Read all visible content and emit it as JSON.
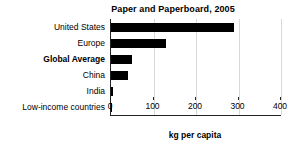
{
  "chart_data": {
    "type": "bar",
    "orientation": "horizontal",
    "title": "Paper and Paperboard, 2005",
    "xlabel": "kg per capita",
    "ylabel": "",
    "xlim": [
      0,
      400
    ],
    "xticks": [
      0,
      100,
      200,
      300,
      400
    ],
    "xtick_labels": [
      "0",
      "100",
      "200",
      "300",
      "400"
    ],
    "grid": true,
    "legend": "none",
    "bar_color": "#000000",
    "categories": [
      "United States",
      "Europe",
      "Global Average",
      "China",
      "India",
      "Low-income countries"
    ],
    "values": [
      290,
      130,
      50,
      40,
      5,
      1
    ],
    "emphasized_category": "Global Average",
    "bars": [
      {
        "label": "United States",
        "value": 290,
        "bold": false
      },
      {
        "label": "Europe",
        "value": 130,
        "bold": false
      },
      {
        "label": "Global Average",
        "value": 50,
        "bold": true
      },
      {
        "label": "China",
        "value": 40,
        "bold": false
      },
      {
        "label": "India",
        "value": 5,
        "bold": false
      },
      {
        "label": "Low-income countries",
        "value": 1,
        "bold": false
      }
    ]
  },
  "colors": {
    "background": "#ffffff",
    "bar": "#000000",
    "axis": "#222222",
    "gridline": "#d8d8d8",
    "text": "#000000"
  }
}
